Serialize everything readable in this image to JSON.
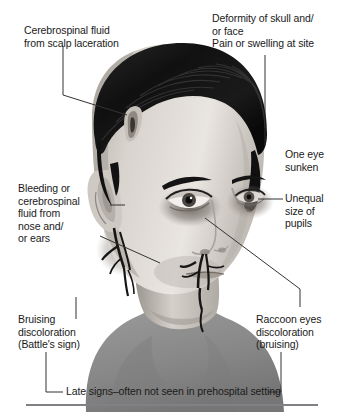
{
  "figure": {
    "background_color": "#ffffff",
    "line_color": "#333333",
    "text_color": "#1a1a1a",
    "rule_color": "#7f8184"
  },
  "labels": {
    "csf_scalp": "Cerebrospinal fluid\nfrom scalp laceration",
    "deformity": "Deformity of skull and/\nor face\nPain or swelling at site",
    "one_eye_sunken": "One eye\nsunken",
    "unequal_pupils": "Unequal\nsize of\npupils",
    "bleeding_nose_ears": "Bleeding or\ncerebrospinal\nfluid from\nnose and/\nor ears",
    "battles_sign": "Bruising\ndiscoloration\n(Battle's sign)",
    "raccoon_eyes": "Raccoon eyes\ndiscoloration\n(bruising)",
    "late_signs": "Late signs–often not seen in prehospital setting"
  },
  "illustration": {
    "hair_color": "#151515",
    "skin_light": "#e8e4e0",
    "skin_mid": "#c9c3bd",
    "skin_shadow": "#9e9892",
    "bruise_color": "#6e6862",
    "shirt_color": "#8d8d8d",
    "blood_color": "#1c1c1c",
    "laceration_color": "#b9b4ae"
  },
  "leader_lines": [
    {
      "name": "csf-scalp-leader",
      "points": "63,46 63,95 126,114"
    },
    {
      "name": "deformity-leader",
      "points": "265,55 265,146"
    },
    {
      "name": "unequal-pupils-leader",
      "points": "283,199 257,199"
    },
    {
      "name": "bleeding-ear-leader-1",
      "points": "110,205 126,205"
    },
    {
      "name": "bleeding-ear-leader-2",
      "points": "100,236 158,262"
    },
    {
      "name": "raccoon-eyes-leader",
      "points": "205,218 300,288 300,306"
    },
    {
      "name": "battles-sign-leader",
      "points": "76,297 76,318"
    },
    {
      "name": "late-signs-bracket",
      "points": "46,353 46,392 64,392"
    },
    {
      "name": "late-signs-bracket-right",
      "points": "262,392 280,392 280,353"
    }
  ]
}
